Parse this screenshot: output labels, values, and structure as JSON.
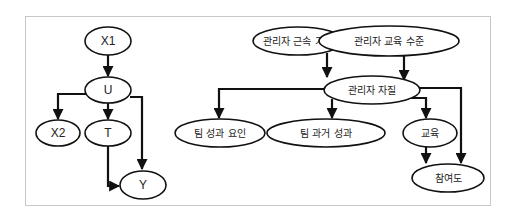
{
  "left_diagram": {
    "nodes": [
      {
        "id": "X1",
        "label": "X1"
      },
      {
        "id": "U",
        "label": "U"
      },
      {
        "id": "X2",
        "label": "X2"
      },
      {
        "id": "T",
        "label": "T"
      },
      {
        "id": "Y",
        "label": "Y"
      }
    ],
    "edges": [
      {
        "from": "X1",
        "to": "U"
      },
      {
        "from": "U",
        "to": "X2"
      },
      {
        "from": "U",
        "to": "T"
      },
      {
        "from": "U",
        "to": "Y"
      },
      {
        "from": "T",
        "to": "Y"
      }
    ]
  },
  "right_diagram": {
    "nodes": [
      {
        "id": "tenure",
        "label": "관리자 근속 기간"
      },
      {
        "id": "edu_level",
        "label": "관리자 교육 수준"
      },
      {
        "id": "quality",
        "label": "관리자 자질"
      },
      {
        "id": "team_factors",
        "label": "팀 성과 요인"
      },
      {
        "id": "team_past",
        "label": "팀 과거 성과"
      },
      {
        "id": "training",
        "label": "교육"
      },
      {
        "id": "engagement",
        "label": "참여도"
      }
    ],
    "edges": [
      {
        "from": "tenure",
        "to": "quality"
      },
      {
        "from": "edu_level",
        "to": "quality"
      },
      {
        "from": "quality",
        "to": "team_factors"
      },
      {
        "from": "quality",
        "to": "team_past"
      },
      {
        "from": "quality",
        "to": "training"
      },
      {
        "from": "quality",
        "to": "engagement"
      },
      {
        "from": "training",
        "to": "engagement"
      }
    ]
  }
}
